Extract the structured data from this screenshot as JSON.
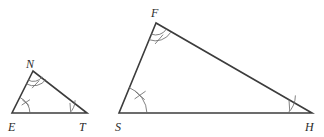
{
  "figure": {
    "stroke_color": "#3c3c3c",
    "mark_color": "#6b6b6b",
    "background_color": "#ffffff",
    "triangles": [
      {
        "name": "triangle-net",
        "vertices": [
          {
            "label": "N",
            "role": "apex",
            "mark": "double-arc-single-slash"
          },
          {
            "label": "E",
            "role": "bottom-left",
            "mark": "single-arc-double-slash"
          },
          {
            "label": "T",
            "role": "bottom-right",
            "mark": "single-arc-single-slash"
          }
        ]
      },
      {
        "name": "triangle-fsh",
        "vertices": [
          {
            "label": "F",
            "role": "apex",
            "mark": "double-arc-single-slash"
          },
          {
            "label": "S",
            "role": "bottom-left",
            "mark": "single-arc-double-slash"
          },
          {
            "label": "H",
            "role": "bottom-right",
            "mark": "single-arc-single-slash"
          }
        ]
      }
    ]
  }
}
